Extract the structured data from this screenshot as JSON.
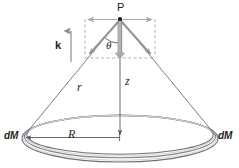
{
  "figure": {
    "background_color": "#ffffff",
    "width": 239,
    "height": 168,
    "colors": {
      "ink": "#231f20",
      "cone_line": "#6d6e71",
      "vector_gray": "#939598",
      "dashed_gray": "#a7a9ac",
      "ring_outline": "#58595b",
      "ring_fill": "#d9d9d9",
      "axis_line": "#58595b"
    },
    "labels": {
      "point_p": "P",
      "unit_vector_k": "k",
      "angle_theta": "θ",
      "distance_r": "r",
      "distance_z": "z",
      "radius_R": "R",
      "mass_element_left": "dM",
      "mass_element_right": "dM"
    },
    "geometry": {
      "point_p": {
        "x": 120,
        "y": 18
      },
      "ring_center": {
        "x": 120,
        "y": 137
      },
      "ring_radius_x": 98,
      "ring_radius_y": 23,
      "ring_tube_thickness": 4,
      "dashed_box": {
        "x": 85,
        "y": 18,
        "width": 70,
        "height": 40
      },
      "k_arrow": {
        "x": 62,
        "y_top": 30,
        "y_bottom": 62
      }
    },
    "elements": [
      "horizontal double-headed arrow through P",
      "dashed reference rectangle below P",
      "two gray diagonal component arrows from P",
      "vertical double-line arrow from P (z component)",
      "angle arc marking theta at P",
      "slant line r from P to ring edge",
      "axis line z from P to ring center",
      "radius arrow R from ring center to ring edge",
      "elliptical ring drawn as a torus"
    ]
  }
}
